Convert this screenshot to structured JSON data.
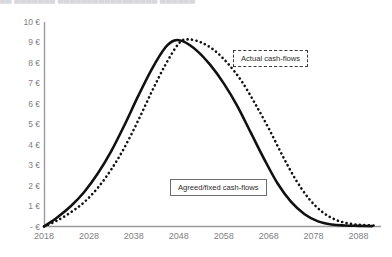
{
  "header": {
    "clipped_title": "██  ███████   █████████████████  ██████"
  },
  "callouts": {
    "actual_label": "Actual cash-flows",
    "agreed_label": "Agreed/fixed cash-flows"
  },
  "chart_data": {
    "type": "line",
    "title": "",
    "xlabel": "",
    "ylabel": "",
    "xlim": [
      2018,
      2093
    ],
    "ylim": [
      0,
      10
    ],
    "grid": false,
    "legend_position": "inline-callouts",
    "x_tick_labels": [
      "2018",
      "2028",
      "2038",
      "2048",
      "2058",
      "2068",
      "2078",
      "2088"
    ],
    "x_ticks": [
      2018,
      2028,
      2038,
      2048,
      2058,
      2068,
      2078,
      2088
    ],
    "y_tick_labels": [
      "10 €",
      "9 €",
      "8 €",
      "7 €",
      "6 €",
      "5 €",
      "4 €",
      "3 €",
      "2 €",
      "1 €",
      "- €"
    ],
    "y_ticks": [
      10,
      9,
      8,
      7,
      6,
      5,
      4,
      3,
      2,
      1,
      0
    ],
    "axis_color": "#9a9a9e",
    "series": [
      {
        "name": "Agreed/fixed cash-flows",
        "style": "solid",
        "color": "#111111",
        "width": 2.6,
        "x": [
          2018,
          2021,
          2024,
          2027,
          2030,
          2033,
          2036,
          2039,
          2042,
          2045,
          2047,
          2049,
          2052,
          2055,
          2058,
          2061,
          2064,
          2067,
          2070,
          2073,
          2076,
          2079,
          2082,
          2085,
          2088,
          2091
        ],
        "values": [
          0.0,
          0.45,
          1.0,
          1.7,
          2.6,
          3.7,
          5.0,
          6.4,
          7.7,
          8.75,
          9.1,
          9.05,
          8.6,
          7.9,
          7.0,
          5.9,
          4.6,
          3.3,
          2.1,
          1.2,
          0.6,
          0.25,
          0.1,
          0.05,
          0.03,
          0.02
        ]
      },
      {
        "name": "Actual cash-flows",
        "style": "dotted",
        "color": "#111111",
        "width": 2.6,
        "x": [
          2018,
          2021,
          2024,
          2027,
          2030,
          2033,
          2036,
          2039,
          2042,
          2045,
          2048,
          2050,
          2053,
          2056,
          2059,
          2062,
          2065,
          2068,
          2071,
          2074,
          2077,
          2080,
          2083,
          2086,
          2089,
          2092
        ],
        "values": [
          0.0,
          0.3,
          0.7,
          1.2,
          1.9,
          2.8,
          3.9,
          5.2,
          6.6,
          7.9,
          8.95,
          9.15,
          9.0,
          8.6,
          7.95,
          7.1,
          6.0,
          4.8,
          3.5,
          2.3,
          1.35,
          0.7,
          0.32,
          0.14,
          0.07,
          0.04
        ]
      }
    ]
  }
}
